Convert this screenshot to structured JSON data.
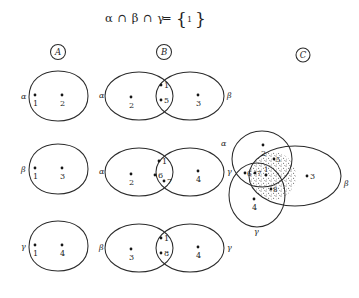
{
  "figure": {
    "title": {
      "lhs": "α ∩ β ∩ γ",
      "equals": "=",
      "brace_open": "{",
      "set_member": "1",
      "brace_close": "}",
      "full": "α ∩ β ∩ γ = { 1 }"
    },
    "column_headers": [
      {
        "id": "col-a",
        "label": "A"
      },
      {
        "id": "col-b",
        "label": "B"
      },
      {
        "id": "col-c",
        "label": "C"
      }
    ],
    "colors": {
      "ink": "#2b2b2b",
      "point": "#161616",
      "background": "#ffffff",
      "stipple": "#3a3a3a"
    },
    "rows": [
      {
        "id": "row-1",
        "col_a": {
          "type": "single-set",
          "set_label": "α",
          "elements": [
            "1",
            "2"
          ]
        },
        "col_b": {
          "type": "two-set-intersection",
          "left_label": "α",
          "right_label": "β",
          "left_only": [
            "2"
          ],
          "intersection": [
            "1",
            "5"
          ],
          "right_only": [
            "3"
          ]
        }
      },
      {
        "id": "row-2",
        "col_a": {
          "type": "single-set",
          "set_label": "β",
          "elements": [
            "1",
            "3"
          ]
        },
        "col_b": {
          "type": "two-set-intersection",
          "left_label": "α",
          "right_label": "γ",
          "left_only": [
            "2"
          ],
          "intersection": [
            "1",
            "6",
            "7"
          ],
          "right_only": [
            "4"
          ]
        }
      },
      {
        "id": "row-3",
        "col_a": {
          "type": "single-set",
          "set_label": "γ",
          "elements": [
            "1",
            "4"
          ]
        },
        "col_b": {
          "type": "two-set-intersection",
          "left_label": "β",
          "right_label": "γ",
          "left_only": [
            "3"
          ],
          "intersection": [
            "1",
            "8"
          ],
          "right_only": [
            "4"
          ]
        }
      }
    ],
    "col_c_diagram": {
      "type": "three-set-venn",
      "set_labels": {
        "alpha": "α",
        "beta": "β",
        "gamma": "γ"
      },
      "regions": {
        "alpha_only": [
          "2"
        ],
        "beta_only": [
          "3"
        ],
        "gamma_only": [
          "4"
        ],
        "alpha_gamma_only": [
          "6",
          "7"
        ],
        "alpha_beta_only": [
          "5"
        ],
        "beta_gamma_only": [
          "8"
        ],
        "triple_intersection": [
          "1"
        ]
      },
      "shaded_region": "beta",
      "shading_style": "stipple"
    }
  }
}
